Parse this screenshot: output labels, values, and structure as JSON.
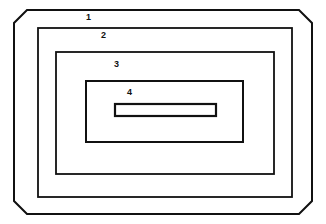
{
  "figure": {
    "type": "technical-line-drawing",
    "background_color": "#ffffff",
    "stroke_color": "#111111",
    "canvas": {
      "width": 326,
      "height": 224
    },
    "shapes": [
      {
        "id": "outer-housing",
        "label": "1",
        "kind": "chamfered-rectangle",
        "x": 14,
        "y": 10,
        "width": 298,
        "height": 204,
        "chamfer": 13,
        "stroke_width": 2.0
      },
      {
        "id": "second-frame",
        "label": "2",
        "kind": "rectangle",
        "x": 38,
        "y": 28,
        "width": 254,
        "height": 169,
        "stroke_width": 1.8
      },
      {
        "id": "third-frame",
        "label": "3",
        "kind": "rectangle",
        "x": 56,
        "y": 52,
        "width": 218,
        "height": 122,
        "stroke_width": 1.8
      },
      {
        "id": "inner-frame",
        "label": "4",
        "kind": "rectangle",
        "x": 86,
        "y": 81,
        "width": 157,
        "height": 61,
        "stroke_width": 2.0
      },
      {
        "id": "slot",
        "label": "",
        "kind": "rectangle",
        "x": 115,
        "y": 104,
        "width": 101,
        "height": 12,
        "stroke_width": 2.2
      }
    ],
    "labels": [
      {
        "id": "label-1",
        "text": "1",
        "x": 86,
        "y": 13
      },
      {
        "id": "label-2",
        "text": "2",
        "x": 101,
        "y": 31
      },
      {
        "id": "label-3",
        "text": "3",
        "x": 114,
        "y": 60
      },
      {
        "id": "label-4",
        "text": "4",
        "x": 127,
        "y": 88
      }
    ]
  }
}
